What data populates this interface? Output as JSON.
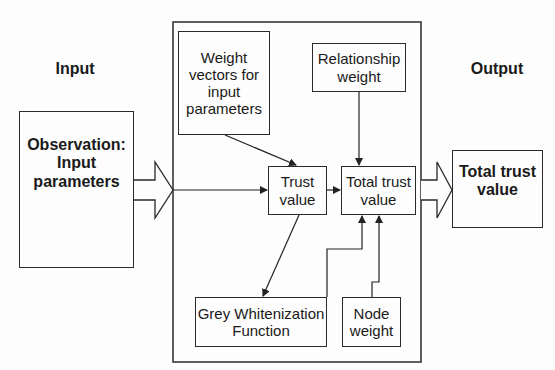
{
  "diagram": {
    "section_labels": {
      "input": "Input",
      "output": "Output"
    },
    "nodes": {
      "observation": "Observation:\nInput\nparameters",
      "weight_vectors": "Weight\nvectors for\ninput\nparameters",
      "relationship_weight": "Relationship\nweight",
      "trust_value": "Trust\nvalue",
      "total_trust_value_inner": "Total trust\nvalue",
      "grey_whitenization": "Grey Whitenization\nFunction",
      "node_weight": "Node\nweight",
      "total_trust_value_output": "Total trust\nvalue"
    },
    "edges": [
      {
        "from": "observation",
        "to": "trust_value",
        "type": "block-arrow"
      },
      {
        "from": "weight_vectors",
        "to": "trust_value",
        "type": "arrow"
      },
      {
        "from": "trust_value",
        "to": "total_trust_value_inner",
        "type": "arrow"
      },
      {
        "from": "relationship_weight",
        "to": "total_trust_value_inner",
        "type": "arrow"
      },
      {
        "from": "trust_value",
        "to": "grey_whitenization",
        "type": "arrow"
      },
      {
        "from": "grey_whitenization",
        "to": "total_trust_value_inner",
        "type": "elbow-arrow"
      },
      {
        "from": "node_weight",
        "to": "total_trust_value_inner",
        "type": "elbow-arrow"
      },
      {
        "from": "total_trust_value_inner",
        "to": "total_trust_value_output",
        "type": "block-arrow"
      }
    ]
  }
}
